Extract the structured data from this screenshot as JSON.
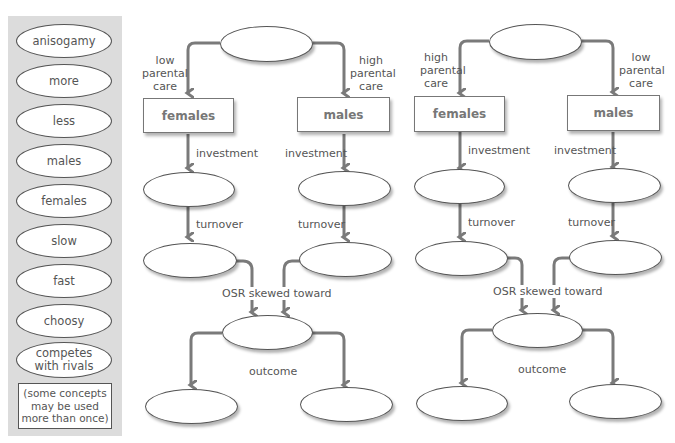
{
  "word_bank": {
    "items": [
      "anisogamy",
      "more",
      "less",
      "males",
      "females",
      "slow",
      "fast",
      "choosy",
      "competes with rivals"
    ],
    "note": "(some concepts may be used more than once)"
  },
  "diagrams": [
    {
      "left_care_label": "low parental care",
      "right_care_label": "high parental care",
      "left_box": "females",
      "right_box": "males",
      "investment_label": "investment",
      "turnover_label": "turnover",
      "osr_label": "OSR skewed toward",
      "outcome_label": "outcome"
    },
    {
      "left_care_label": "high parental care",
      "right_care_label": "low parental care",
      "left_box": "females",
      "right_box": "males",
      "investment_label": "investment",
      "turnover_label": "turnover",
      "osr_label": "OSR skewed toward",
      "outcome_label": "outcome"
    }
  ],
  "colors": {
    "arrow": "#7a7a7a",
    "bank_bg": "#dcdcdc",
    "text": "#555555"
  }
}
